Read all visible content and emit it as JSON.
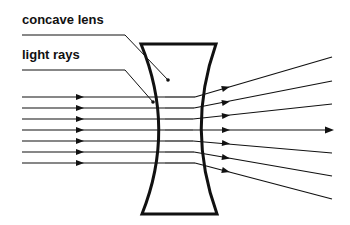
{
  "diagram": {
    "type": "optics",
    "labels": {
      "lens": "concave lens",
      "rays": "light rays"
    },
    "colors": {
      "line": "#111111",
      "background": "#ffffff"
    },
    "incoming_rays": {
      "count": 7,
      "direction": "parallel, left to right",
      "y": [
        97,
        108,
        119,
        130,
        141,
        152,
        163
      ]
    },
    "outgoing_rays": {
      "count": 7,
      "direction": "diverging after lens",
      "end_y": [
        57,
        81,
        104,
        129,
        153,
        176,
        199
      ]
    }
  }
}
